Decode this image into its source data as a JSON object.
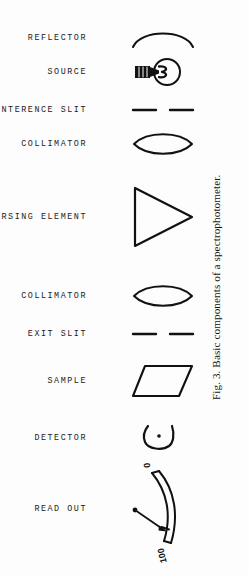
{
  "figure": {
    "caption": "Fig. 3.   Basic components of a spectrophotometer.",
    "background_color": "#fdfdfd",
    "ink_color": "#111111",
    "width": 249,
    "height": 575
  },
  "rows": [
    {
      "label": "REFLECTOR",
      "symbol": "concave-mirror-arc",
      "y": 38
    },
    {
      "label": "SOURCE",
      "symbol": "light-bulb-lamp",
      "y": 72
    },
    {
      "label": "ENTERENCE SLIT",
      "symbol": "slit-pair",
      "y": 110
    },
    {
      "label": "COLLIMATOR",
      "symbol": "biconvex-lens",
      "y": 144
    },
    {
      "label": "DISPERSING ELEMENT",
      "symbol": "prism-triangle",
      "y": 217
    },
    {
      "label": "COLLIMATOR",
      "symbol": "biconvex-lens",
      "y": 296
    },
    {
      "label": "EXIT SLIT",
      "symbol": "slit-pair",
      "y": 334
    },
    {
      "label": "SAMPLE",
      "symbol": "sample-parallelogram",
      "y": 381
    },
    {
      "label": "DETECTOR",
      "symbol": "phototube-cup",
      "y": 438
    },
    {
      "label": "READ OUT",
      "symbol": "meter-gauge",
      "y": 509
    }
  ],
  "meter": {
    "scale_min_label": "0",
    "scale_max_label": "100"
  }
}
